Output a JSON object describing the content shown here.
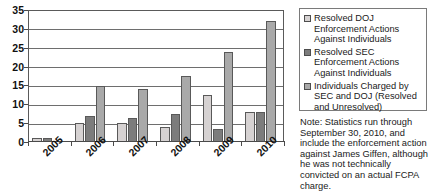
{
  "chart_data": {
    "type": "bar",
    "title": "",
    "xlabel": "",
    "ylabel": "",
    "categories": [
      "2005",
      "2006",
      "2007",
      "2008",
      "2009",
      "2010"
    ],
    "ylim": [
      0,
      35
    ],
    "yticks": [
      0,
      5,
      10,
      15,
      20,
      25,
      30,
      35
    ],
    "ytick_labels": [
      "0",
      "5",
      "10",
      "15",
      "20",
      "25",
      "30",
      "35"
    ],
    "grid": true,
    "legend_position": "right",
    "series": [
      {
        "name": "Resolved DOJ Enforcement Actions Against Individuals",
        "color": "#d6d2d2",
        "values": [
          1,
          5,
          5,
          4,
          12.5,
          8
        ]
      },
      {
        "name": "Resolved SEC Enforcement Actions Against Individuals",
        "color": "#7c7c7c",
        "values": [
          1,
          6.8,
          6.5,
          7.5,
          3.5,
          8
        ]
      },
      {
        "name": "Individuals Charged by SEC and DOJ (Resolved and Unresolved)",
        "color": "#a9a9a9",
        "values": [
          0,
          14.8,
          14,
          17.5,
          24,
          32
        ]
      }
    ]
  },
  "legend": {
    "items": [
      {
        "swatch_name": "legend-swatch-resolved-doj",
        "label": "Resolved DOJ Enforcement Actions Against Individuals"
      },
      {
        "swatch_name": "legend-swatch-resolved-sec",
        "label": "Resolved SEC Enforcement Actions Against Individuals"
      },
      {
        "swatch_name": "legend-swatch-individuals-charged",
        "label": "Individuals Charged by SEC and DOJ (Resolved and Unresolved)"
      }
    ]
  },
  "note": {
    "text": "Note: Statistics run through September 30, 2010, and include the enforcement action against James Giffen, although he was not technically convicted on an actual FCPA charge."
  }
}
